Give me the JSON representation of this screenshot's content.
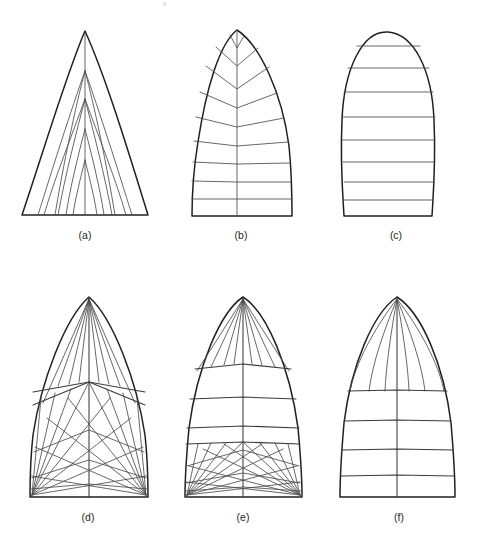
{
  "figure": {
    "background_color": "#ffffff",
    "outline_color": "#231f20",
    "seam_color": "#4d4d50",
    "width": 484,
    "height": 545,
    "panel_count": 6
  },
  "captions": {
    "a": "(a)",
    "b": "(b)",
    "c": "(c)",
    "d": "(d)",
    "e": "(e)",
    "f": "(f)"
  },
  "panels": [
    {
      "key": "a",
      "caption": "(a)",
      "shape": "pointed-peak sail with curved leeches",
      "seam_style": "mitre / vertical nested panels converging on centre seam",
      "apex": {
        "x": 85,
        "y": 31
      },
      "base": {
        "left_x": 22,
        "right_x": 148,
        "y": 215
      },
      "centre_seam": true,
      "seam_lines": 10
    },
    {
      "key": "b",
      "caption": "(b)",
      "shape": "rounded-head sail with narrow peak and notch",
      "seam_style": "chevron (V) seams at head grading to horizontal cross-cut panels",
      "apex": {
        "x": 237,
        "y": 30
      },
      "base": {
        "left_x": 192,
        "right_x": 292,
        "y": 216
      },
      "centre_seam": true,
      "seam_lines": 9,
      "head_notch": true
    },
    {
      "key": "c",
      "caption": "(c)",
      "shape": "full elliptical / egg-shaped sail",
      "seam_style": "plain horizontal cross-cut panels",
      "apex": {
        "x": 388,
        "y": 32
      },
      "base": {
        "left_x": 344,
        "right_x": 432,
        "y": 216
      },
      "centre_seam": false,
      "seam_lines": 8
    },
    {
      "key": "d",
      "caption": "(d)",
      "shape": "pointed-head spinnaker",
      "seam_style": "full radial / star-cut — panels radiate from head and both clews",
      "apex": {
        "x": 89,
        "y": 297
      },
      "base": {
        "left_x": 30,
        "right_x": 148,
        "y": 497
      },
      "centre_seam": true,
      "radial_head_lines": 9,
      "radial_clew_lines": 9
    },
    {
      "key": "e",
      "caption": "(e)",
      "shape": "rounded-head spinnaker",
      "seam_style": "radial head and radial clews with horizontal cross-cut mid panels",
      "apex": {
        "x": 243,
        "y": 297
      },
      "base": {
        "left_x": 185,
        "right_x": 302,
        "y": 497
      },
      "centre_seam": true,
      "radial_head_lines": 9,
      "cross_cut_seams": 3,
      "radial_clew_lines": 9
    },
    {
      "key": "f",
      "caption": "(f)",
      "shape": "rounded-head spinnaker",
      "seam_style": "radial head panels over horizontal cross-cut body",
      "apex": {
        "x": 397,
        "y": 297
      },
      "base": {
        "left_x": 340,
        "right_x": 455,
        "y": 497
      },
      "centre_seam": true,
      "radial_head_lines": 7,
      "cross_cut_seams": 4
    }
  ]
}
